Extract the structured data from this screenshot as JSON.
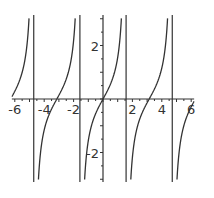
{
  "chart_data": {
    "type": "line",
    "title": "",
    "function": "tan(x)",
    "xlabel": "",
    "ylabel": "",
    "xlim": [
      -6.2,
      6.2
    ],
    "ylim": [
      -3.1,
      3.1
    ],
    "x_ticks": [
      -6,
      -4,
      -2,
      2,
      4,
      6
    ],
    "x_tick_labels": [
      "-6",
      "-4",
      "-2",
      "2",
      "4",
      "6"
    ],
    "y_ticks": [
      2,
      -2
    ],
    "y_tick_labels": [
      "2",
      "-2"
    ],
    "asymptotes": [
      -4.712,
      -1.571,
      1.571,
      4.712
    ],
    "grid": false,
    "legend": null,
    "series": [
      {
        "name": "tan(x)",
        "color": "#333333"
      }
    ]
  },
  "colors": {
    "curve": "#333333",
    "axis": "#333333",
    "background": "#ffffff"
  }
}
